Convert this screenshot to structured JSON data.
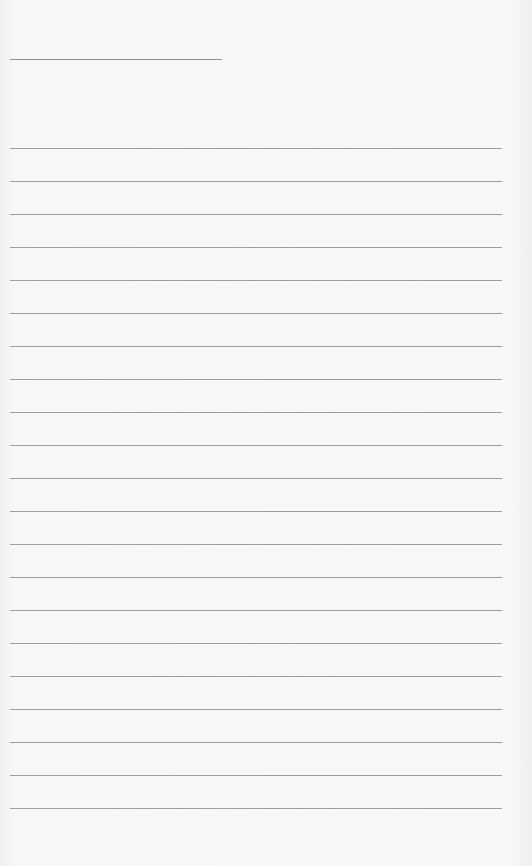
{
  "document": {
    "type": "lined-paper",
    "background_color": "#f6f6f4",
    "line_color": "#9e9e9e",
    "title_line": {
      "text": "",
      "x": 10,
      "y": 59,
      "width": 212
    },
    "rules": {
      "count": 21,
      "first_y": 148,
      "spacing": 33,
      "x": 10,
      "width": 492,
      "lines": [
        "",
        "",
        "",
        "",
        "",
        "",
        "",
        "",
        "",
        "",
        "",
        "",
        "",
        "",
        "",
        "",
        "",
        "",
        "",
        "",
        ""
      ]
    }
  }
}
